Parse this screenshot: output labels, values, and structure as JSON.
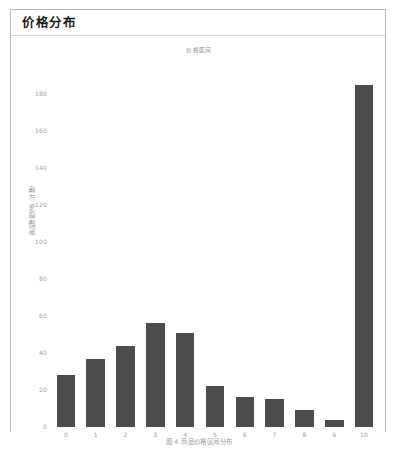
{
  "panel": {
    "header_title": "价格分布"
  },
  "caption": "图 4  商品价格区间分布",
  "colors": {
    "bar": "#4d4d4d",
    "panel_border": "#b9b9b9",
    "header_rule": "#d2d2d2",
    "tick_text": "#a0a0a0",
    "title_text": "#1b1b1b",
    "background": "#ffffff"
  },
  "chart_data": {
    "type": "bar",
    "title": "价格区间",
    "xlabel": "",
    "ylabel": "商品数量分布（计数）",
    "categories": [
      "0",
      "1",
      "2",
      "3",
      "4",
      "5",
      "6",
      "7",
      "8",
      "9",
      "10"
    ],
    "values": [
      28,
      37,
      44,
      56,
      51,
      22,
      16,
      15,
      9,
      4,
      185
    ],
    "yticks": [
      0,
      20,
      40,
      60,
      80,
      100,
      120,
      140,
      160,
      180
    ],
    "ytick_labels": [
      "0",
      "20",
      "40",
      "60",
      "80",
      "100",
      "120",
      "140",
      "160",
      "180"
    ],
    "ylim": [
      0,
      192
    ],
    "grid": false,
    "legend": false
  }
}
